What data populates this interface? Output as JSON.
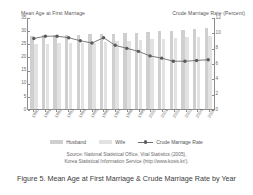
{
  "chart_data": {
    "type": "bar",
    "title": "Figure 5. Mean Age at First Marriage & Crude Marriage Rate by Year",
    "xlabel": "",
    "ylabel": "Mean Age at First Marriage",
    "y2label": "Crude Marriage Rate (Percent)",
    "ylim": [
      0,
      35
    ],
    "y2lim": [
      0,
      12
    ],
    "yticks": [
      0,
      5,
      10,
      15,
      20,
      25,
      30,
      35
    ],
    "y2ticks": [
      0,
      2,
      4,
      6,
      8,
      10,
      12
    ],
    "grid": false,
    "legend_position": "bottom",
    "categories": [
      "1990",
      "1991",
      "1992",
      "1993",
      "1994",
      "1995",
      "1996",
      "1997",
      "1998",
      "1999",
      "2000",
      "2001",
      "2002",
      "2003",
      "2004",
      "2005"
    ],
    "series": [
      {
        "name": "Husband",
        "type": "bar",
        "axis": "left",
        "color": "#cfcfcf",
        "values": [
          27.8,
          28.0,
          28.0,
          28.1,
          28.2,
          28.4,
          28.4,
          28.6,
          28.8,
          29.1,
          29.3,
          29.6,
          29.8,
          30.1,
          30.6,
          30.9
        ]
      },
      {
        "name": "Wife",
        "type": "bar",
        "axis": "left",
        "color": "#e2e2e2",
        "values": [
          24.8,
          24.9,
          25.0,
          25.1,
          25.1,
          25.3,
          25.5,
          25.7,
          26.0,
          26.3,
          26.5,
          26.8,
          27.0,
          27.3,
          27.5,
          27.7
        ]
      },
      {
        "name": "Crude Marriage Rate",
        "type": "line",
        "axis": "right",
        "color": "#5a5a5a",
        "values": [
          9.3,
          9.6,
          9.6,
          9.4,
          9.0,
          8.7,
          9.4,
          8.4,
          8.0,
          7.6,
          7.0,
          6.7,
          6.3,
          6.3,
          6.4,
          6.5
        ]
      }
    ],
    "legend": [
      "Husband",
      "Wife",
      "Crude Marriage Rate"
    ]
  },
  "source": {
    "line1": "Source: National Statistical Office, Vital Statistics (2005),",
    "line2": "Korea Statistical Information Service (http://www.kosis.kr/)."
  }
}
